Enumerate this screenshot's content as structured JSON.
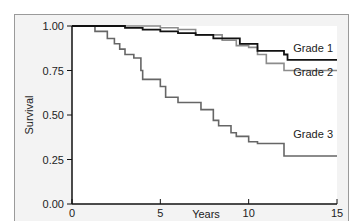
{
  "chart_data": {
    "type": "line",
    "subtype": "kaplan-meier step",
    "title": "",
    "xlabel": "Years",
    "ylabel": "Survival",
    "xlim": [
      0,
      15
    ],
    "ylim": [
      0,
      1
    ],
    "xticks": [
      "0",
      "5",
      "10",
      "15"
    ],
    "yticks": [
      "0.00",
      "0.25",
      "0.50",
      "0.75",
      "1.00"
    ],
    "grid": false,
    "legend_position": "inline-right",
    "series": [
      {
        "name": "Grade 1",
        "color": "#111111",
        "x": [
          0,
          3.0,
          4.0,
          5.0,
          6.0,
          7.0,
          8.0,
          9.5,
          10.5,
          12.0,
          12.2,
          15
        ],
        "values": [
          1.0,
          0.99,
          0.98,
          0.97,
          0.96,
          0.95,
          0.93,
          0.9,
          0.86,
          0.84,
          0.81,
          0.81
        ]
      },
      {
        "name": "Grade 2",
        "color": "#8c8c8c",
        "x": [
          0,
          5.0,
          6.0,
          7.0,
          8.5,
          9.3,
          10.0,
          10.5,
          11.0,
          12.0,
          15
        ],
        "values": [
          1.0,
          0.99,
          0.98,
          0.95,
          0.92,
          0.89,
          0.88,
          0.84,
          0.79,
          0.75,
          0.75
        ]
      },
      {
        "name": "Grade 3",
        "color": "#666666",
        "x": [
          0,
          1.3,
          2.0,
          2.4,
          2.7,
          3.0,
          3.5,
          3.9,
          4.0,
          5.0,
          5.3,
          6.0,
          7.3,
          8.0,
          8.3,
          9.0,
          9.3,
          10.0,
          10.5,
          12.0,
          15
        ],
        "values": [
          1.0,
          0.97,
          0.93,
          0.9,
          0.87,
          0.84,
          0.82,
          0.75,
          0.7,
          0.66,
          0.6,
          0.57,
          0.53,
          0.47,
          0.44,
          0.4,
          0.38,
          0.35,
          0.34,
          0.27,
          0.27
        ]
      }
    ]
  },
  "labels": {
    "xlabel": "Years",
    "ylabel": "Survival",
    "xticks": [
      "0",
      "5",
      "10",
      "15"
    ],
    "yticks": [
      "0.00",
      "0.25",
      "0.50",
      "0.75",
      "1.00"
    ],
    "legend": [
      "Grade 1",
      "Grade 2",
      "Grade 3"
    ]
  }
}
